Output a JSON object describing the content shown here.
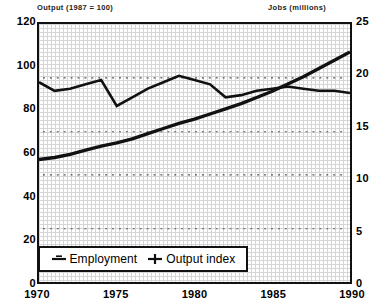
{
  "chart_data": {
    "type": "line",
    "title": "",
    "xlabel": "",
    "left_axis": {
      "label": "Output (1987 = 100)",
      "ticks": [
        0,
        20,
        40,
        60,
        80,
        100,
        120
      ],
      "ylim": [
        0,
        120
      ]
    },
    "right_axis": {
      "label": "Jobs (millions)",
      "ticks": [
        0,
        5,
        10,
        15,
        20,
        25
      ],
      "ylim": [
        0,
        25
      ]
    },
    "x": [
      1970,
      1971,
      1972,
      1973,
      1974,
      1975,
      1976,
      1977,
      1978,
      1979,
      1980,
      1981,
      1982,
      1983,
      1984,
      1985,
      1986,
      1987,
      1988,
      1989,
      1990
    ],
    "xticks": [
      1970,
      1975,
      1980,
      1985,
      1990
    ],
    "grid": true,
    "legend_position": "bottom-left",
    "series": [
      {
        "name": "Employment",
        "axis": "right",
        "units": "millions",
        "marker": "line",
        "values": [
          11.9,
          12.1,
          12.4,
          12.8,
          13.2,
          13.5,
          13.9,
          14.4,
          14.9,
          15.4,
          15.8,
          16.3,
          16.8,
          17.3,
          17.9,
          18.5,
          19.2,
          19.9,
          20.7,
          21.5,
          22.3
        ]
      },
      {
        "name": "Output index",
        "axis": "left",
        "units": "1987 = 100",
        "marker": "plus",
        "values": [
          93,
          89,
          90,
          92,
          94,
          82,
          86,
          90,
          93,
          96,
          94,
          92,
          86,
          87,
          89,
          90,
          91,
          90,
          89,
          89,
          88
        ]
      }
    ],
    "gridlines_left": [
      25,
      50,
      70,
      95
    ],
    "crossover_year": 1983,
    "colors": {
      "line": "#111111",
      "frame": "#111111",
      "grid": "#b4b4b4"
    }
  }
}
